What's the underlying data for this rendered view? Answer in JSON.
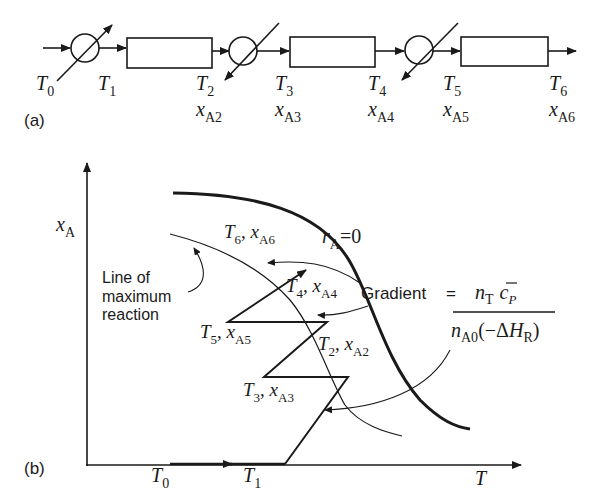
{
  "panel_a": {
    "label": "(a)",
    "streams": [
      {
        "T": "T",
        "T_sub": "0"
      },
      {
        "T": "T",
        "T_sub": "1"
      },
      {
        "T": "T",
        "T_sub": "2",
        "x": "x",
        "x_sub": "A2"
      },
      {
        "T": "T",
        "T_sub": "3",
        "x": "x",
        "x_sub": "A3"
      },
      {
        "T": "T",
        "T_sub": "4",
        "x": "x",
        "x_sub": "A4"
      },
      {
        "T": "T",
        "T_sub": "5",
        "x": "x",
        "x_sub": "A5"
      },
      {
        "T": "T",
        "T_sub": "6",
        "x": "x",
        "x_sub": "A6"
      }
    ],
    "units": [
      "heat-exchanger-1 (heating)",
      "reactor-bed-1",
      "heat-exchanger-2 (cooling)",
      "reactor-bed-2",
      "heat-exchanger-3 (cooling)",
      "reactor-bed-3"
    ]
  },
  "panel_b": {
    "label": "(b)",
    "y_axis": {
      "sym": "x",
      "sub": "A"
    },
    "x_axis": {
      "sym": "T"
    },
    "x_ticks": [
      {
        "sym": "T",
        "sub": "0"
      },
      {
        "sym": "T",
        "sub": "1"
      }
    ],
    "equilibrium_label": {
      "sym": "r",
      "sub": "A",
      "rest": "=0"
    },
    "max_reaction_label": [
      "Line of",
      "maximum",
      "reaction"
    ],
    "points": [
      {
        "T": "T",
        "T_sub": "6",
        "x": "x",
        "x_sub": "A6"
      },
      {
        "T": "T",
        "T_sub": "4",
        "x": "x",
        "x_sub": "A4"
      },
      {
        "T": "T",
        "T_sub": "5",
        "x": "x",
        "x_sub": "A5"
      },
      {
        "T": "T",
        "T_sub": "2",
        "x": "x",
        "x_sub": "A2"
      },
      {
        "T": "T",
        "T_sub": "3",
        "x": "x",
        "x_sub": "A3"
      }
    ],
    "gradient": {
      "label": "Gradient",
      "equals": "=",
      "num_n": "n",
      "num_n_sub": "T",
      "num_c": "c",
      "num_c_sub": "P",
      "den_n": "n",
      "den_n_sub": "A0",
      "den_open": "(−Δ",
      "den_H": "H",
      "den_H_sub": "R",
      "den_close": ")"
    }
  },
  "colors": {
    "ink": "#1a1a1a",
    "background": "#ffffff"
  }
}
